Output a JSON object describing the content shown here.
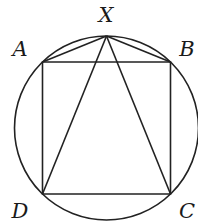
{
  "diagram": {
    "type": "geometry",
    "colors": {
      "stroke": "#222222",
      "background": "#ffffff"
    },
    "circle": {
      "cx": 106.5,
      "cy": 128,
      "r": 92
    },
    "points": {
      "X": {
        "label": "X",
        "x": 106.5,
        "y": 36
      },
      "A": {
        "label": "A",
        "x": 42.5,
        "y": 62
      },
      "B": {
        "label": "B",
        "x": 170.5,
        "y": 62
      },
      "C": {
        "label": "C",
        "x": 170.5,
        "y": 194
      },
      "D": {
        "label": "D",
        "x": 42.5,
        "y": 194
      }
    },
    "segments": [
      "AB",
      "BC",
      "CD",
      "DA",
      "XA",
      "XB",
      "XC",
      "XD"
    ]
  }
}
